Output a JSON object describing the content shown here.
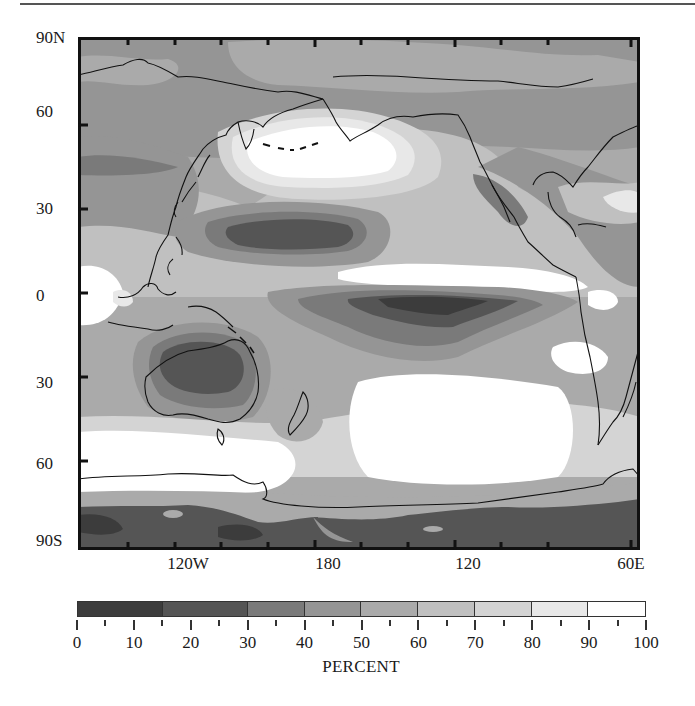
{
  "figure": {
    "type": "map",
    "projection": "cylindrical, Pacific-centered",
    "longitude_labels": [
      {
        "label": "120W",
        "x": 188
      },
      {
        "label": "180",
        "x": 328
      },
      {
        "label": "120",
        "x": 468
      },
      {
        "label": "60E",
        "x": 631
      }
    ],
    "latitude_labels": [
      {
        "label": "90N",
        "y": 38
      },
      {
        "label": "60",
        "y": 112
      },
      {
        "label": "30",
        "y": 209
      },
      {
        "label": "0",
        "y": 296
      },
      {
        "label": "30",
        "y": 383
      },
      {
        "label": "60",
        "y": 464
      },
      {
        "label": "90S",
        "y": 541
      }
    ],
    "note": "Longitude labels as printed on figure (120W, 180, 120, 60E)"
  },
  "colorbar": {
    "title": "PERCENT",
    "range": [
      0,
      100
    ],
    "bins": [
      {
        "from": 0,
        "to": 15,
        "color": "#3c3c3c"
      },
      {
        "from": 15,
        "to": 30,
        "color": "#555555"
      },
      {
        "from": 30,
        "to": 40,
        "color": "#7a7a7a"
      },
      {
        "from": 40,
        "to": 50,
        "color": "#959595"
      },
      {
        "from": 50,
        "to": 60,
        "color": "#aaaaaa"
      },
      {
        "from": 60,
        "to": 70,
        "color": "#c0c0c0"
      },
      {
        "from": 70,
        "to": 80,
        "color": "#d4d4d4"
      },
      {
        "from": 80,
        "to": 90,
        "color": "#e8e8e8"
      },
      {
        "from": 90,
        "to": 100,
        "color": "#ffffff"
      }
    ],
    "tick_labels": [
      "0",
      "10",
      "20",
      "30",
      "40",
      "50",
      "60",
      "70",
      "80",
      "90",
      "100"
    ]
  },
  "regions_described": [
    {
      "name": "North Pacific high (Aleutian/Gulf of Alaska)",
      "value_range": "80-100"
    },
    {
      "name": "Equatorial east Pacific dry tongue",
      "value_range": "0-30"
    },
    {
      "name": "Subtropical North Pacific near Hawaii",
      "value_range": "15-40"
    },
    {
      "name": "Australia interior",
      "value_range": "0-40"
    },
    {
      "name": "Baja California / Mexico",
      "value_range": "30-40"
    },
    {
      "name": "Southern Ocean storm track",
      "value_range": "80-100"
    },
    {
      "name": "Antarctica",
      "value_range": "0-30"
    },
    {
      "name": "Arctic / Siberia / Canada",
      "value_range": "40-60"
    }
  ]
}
